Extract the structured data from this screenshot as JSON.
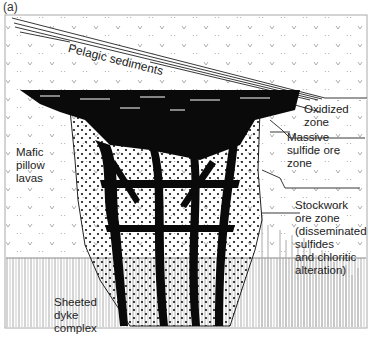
{
  "figure": {
    "panel_label": "(a)",
    "labels": {
      "pelagic": "Pelagic sediments",
      "oxidized": [
        "Oxidized",
        "zone"
      ],
      "massive": [
        "Massive",
        "sulfide ore",
        "zone"
      ],
      "mafic": [
        "Mafic",
        "pillow",
        "lavas"
      ],
      "stockwork": [
        "Stockwork",
        "ore zone",
        "(disseminated",
        "sulfides",
        "and chloritic",
        "alteration)"
      ],
      "sheeted": [
        "Sheeted",
        "dyke",
        "complex"
      ]
    },
    "colors": {
      "ink": "#111111",
      "grey": "#9a9a9a",
      "background": "#ffffff"
    }
  }
}
